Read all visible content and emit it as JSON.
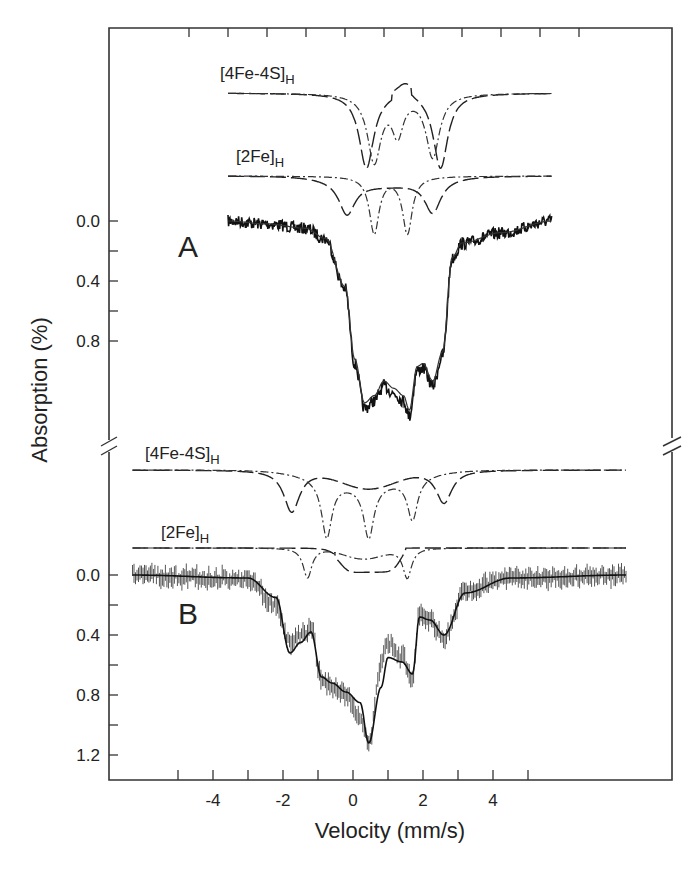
{
  "figure": {
    "ylabel": "Absorption (%)",
    "xlabel": "Velocity (mm/s)",
    "panel_labels": [
      "A",
      "B"
    ],
    "component_labels": {
      "fe4s4": {
        "main": "[4Fe-4S]",
        "sub": "H"
      },
      "fe2": {
        "main": "[2Fe]",
        "sub": "H"
      }
    },
    "colors": {
      "axis": "#333333",
      "data": "#111111",
      "data_b": "#555555",
      "fit": "#222222"
    }
  },
  "chart_data": [
    {
      "type": "line",
      "panel": "A",
      "title": "",
      "xlabel": "Velocity (mm/s)",
      "ylabel": "Absorption (%)",
      "xlim": [
        -5,
        5
      ],
      "x_ticks_top": [
        -5,
        -4,
        -3,
        -2,
        -1,
        0,
        1,
        2,
        3,
        4,
        5
      ],
      "y_tick_labels": [
        "0.0",
        "0.4",
        "0.8"
      ],
      "y_ticks": [
        0.0,
        0.2,
        0.4,
        0.6,
        0.8
      ],
      "y_inverted": true,
      "data_range": [
        -4.0,
        4.3
      ],
      "series": [
        {
          "name": "experimental",
          "style": "noisy-line",
          "x": [
            -4,
            -3,
            -2,
            -1.5,
            -1,
            -0.75,
            -0.5,
            -0.25,
            0,
            0.25,
            0.5,
            0.65,
            0.85,
            1.0,
            1.25,
            1.5,
            1.75,
            2,
            3,
            4.3
          ],
          "y": [
            0.0,
            0.02,
            0.05,
            0.12,
            0.45,
            0.95,
            1.25,
            1.2,
            1.1,
            1.15,
            1.2,
            1.3,
            1.0,
            0.98,
            1.1,
            0.9,
            0.25,
            0.15,
            0.08,
            0.0
          ]
        },
        {
          "name": "fit (total)",
          "style": "solid"
        },
        {
          "name": "[4Fe-4S]H",
          "style": "dashed / dash-dot doublets",
          "lines": [
            {
              "center": -0.45,
              "depth": 0.5
            },
            {
              "center": 1.45,
              "depth": 0.5
            },
            {
              "center": -0.25,
              "depth": 0.45
            },
            {
              "center": 1.25,
              "depth": 0.4
            },
            {
              "center": 0.4,
              "depth": 0.3
            }
          ]
        },
        {
          "name": "[2Fe]H",
          "style": "dashed / dash-dot doublets",
          "lines": [
            {
              "center": -0.95,
              "depth": 0.3
            },
            {
              "center": 1.2,
              "depth": 0.3
            },
            {
              "center": -0.2,
              "depth": 0.5
            },
            {
              "center": 0.6,
              "depth": 0.5
            }
          ]
        }
      ]
    },
    {
      "type": "line",
      "panel": "B",
      "title": "",
      "xlabel": "Velocity (mm/s)",
      "ylabel": "Absorption (%)",
      "xlim": [
        -7,
        7.5
      ],
      "x_ticks": [
        -5,
        -4,
        -3,
        -2,
        -1,
        0,
        1,
        2,
        3,
        4,
        5
      ],
      "x_tick_labels": [
        "-4",
        "-2",
        "0",
        "2",
        "4"
      ],
      "y_tick_labels": [
        "0.0",
        "0.4",
        "0.8",
        "1.2"
      ],
      "y_ticks": [
        0.0,
        0.2,
        0.4,
        0.6,
        0.8,
        1.0,
        1.2
      ],
      "y_inverted": true,
      "data_range": [
        -6.3,
        7.8
      ],
      "series": [
        {
          "name": "experimental",
          "style": "vertical error bars",
          "x": [
            -6.3,
            -3,
            -2.2,
            -1.8,
            -1.5,
            -1.2,
            -0.9,
            -0.6,
            -0.2,
            0.2,
            0.45,
            0.8,
            1.0,
            1.4,
            1.7,
            1.9,
            2.2,
            2.6,
            3.2,
            4.5,
            7.8
          ],
          "y": [
            0.0,
            0.03,
            0.2,
            0.45,
            0.4,
            0.35,
            0.7,
            0.75,
            0.8,
            0.95,
            1.12,
            0.6,
            0.45,
            0.55,
            0.68,
            0.25,
            0.3,
            0.42,
            0.1,
            0.02,
            0.0
          ]
        },
        {
          "name": "fit (total)",
          "style": "solid"
        },
        {
          "name": "[4Fe-4S]H",
          "style": "dashed / dash-dot",
          "lines": [
            {
              "center": -1.75,
              "depth": 0.6
            },
            {
              "center": 2.6,
              "depth": 0.5
            },
            {
              "center": -0.75,
              "depth": 0.8
            },
            {
              "center": 1.7,
              "depth": 0.6
            },
            {
              "center": 0.45,
              "depth": 0.8
            },
            {
              "center": 0.45,
              "depth": 0.15
            }
          ]
        },
        {
          "name": "[2Fe]H",
          "style": "dashed / dash-dot",
          "lines": [
            {
              "center": -1.3,
              "depth": 0.2
            },
            {
              "center": 1.5,
              "depth": 0.2
            },
            {
              "center": -0.1,
              "depth": 0.15
            },
            {
              "center": 0.9,
              "depth": 0.15
            }
          ]
        }
      ]
    }
  ]
}
